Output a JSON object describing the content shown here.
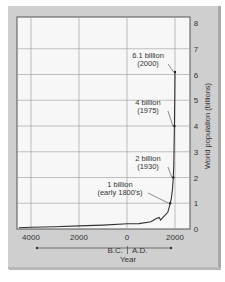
{
  "chart_data": {
    "type": "line",
    "title": "",
    "xlabel": "Year",
    "ylabel": "World population (billions)",
    "era_labels": {
      "left": "B.C.",
      "right": "A.D."
    },
    "x_tick_labels": [
      "4000",
      "2000",
      "0",
      "2000"
    ],
    "x_tick_values": [
      -4000,
      -2000,
      0,
      2000
    ],
    "y_tick_labels": [
      "0",
      "1",
      "2",
      "3",
      "4",
      "5",
      "6",
      "7",
      "8"
    ],
    "xlim": [
      -4500,
      2200
    ],
    "ylim": [
      0,
      8
    ],
    "grid": true,
    "series": [
      {
        "name": "World population",
        "x": [
          -4500,
          -4000,
          -3000,
          -2000,
          -1000,
          0,
          500,
          1000,
          1200,
          1340,
          1400,
          1500,
          1600,
          1700,
          1800,
          1850,
          1900,
          1930,
          1950,
          1960,
          1975,
          1990,
          2000
        ],
        "values": [
          0.05,
          0.07,
          0.09,
          0.12,
          0.15,
          0.2,
          0.21,
          0.28,
          0.4,
          0.45,
          0.35,
          0.45,
          0.55,
          0.65,
          1.0,
          1.2,
          1.6,
          2.0,
          2.5,
          3.0,
          4.0,
          5.3,
          6.1
        ]
      }
    ],
    "annotations": [
      {
        "line1": "6.1 billion",
        "line2": "(2000)",
        "x": 2000,
        "y": 6.1
      },
      {
        "line1": "4 billion",
        "line2": "(1975)",
        "x": 1975,
        "y": 4.0
      },
      {
        "line1": "2 billion",
        "line2": "(1930)",
        "x": 1930,
        "y": 2.0
      },
      {
        "line1": "1 billion",
        "line2": "(early 1800's)",
        "x": 1800,
        "y": 1.0
      }
    ]
  }
}
